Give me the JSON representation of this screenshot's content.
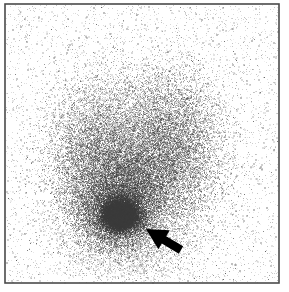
{
  "figure": {
    "name": "scintigram",
    "modality": "nuclear-medicine-scintigraphy",
    "width": 289,
    "height": 292,
    "background_color": "#ffffff",
    "speckle_color": "#3a3a3a",
    "annotation_color": "#000000"
  },
  "frame": {
    "name": "image-border",
    "color": "#4a4a4a",
    "line_width": 1.6,
    "left": 5,
    "top": 4,
    "right": 279,
    "bottom": 283
  },
  "chart_data": {
    "type": "scatter",
    "title": "",
    "subtitle": "",
    "xlabel": "",
    "ylabel": "",
    "grid": false,
    "legend": null,
    "xlim": [
      0,
      289
    ],
    "ylim": [
      0,
      292
    ],
    "background_counts": 5200,
    "background_opacity": 0.3,
    "series": [
      {
        "name": "left-lobe-uptake",
        "shape": "ellipse",
        "cx": 96,
        "cy": 165,
        "rx": 40,
        "ry": 62,
        "counts": 7600,
        "sigma_scale": 0.62,
        "opacity": 0.42
      },
      {
        "name": "right-lobe-uptake",
        "shape": "ellipse",
        "cx": 171,
        "cy": 152,
        "rx": 42,
        "ry": 66,
        "counts": 8000,
        "sigma_scale": 0.62,
        "opacity": 0.42
      },
      {
        "name": "isthmus-bridge-uptake",
        "shape": "ellipse",
        "cx": 133,
        "cy": 186,
        "rx": 34,
        "ry": 40,
        "counts": 4200,
        "sigma_scale": 0.6,
        "opacity": 0.44
      },
      {
        "name": "inferior-pole-uptake",
        "shape": "ellipse",
        "cx": 118,
        "cy": 213,
        "rx": 34,
        "ry": 30,
        "counts": 6200,
        "sigma_scale": 0.58,
        "opacity": 0.5
      },
      {
        "name": "focal-hot-spot",
        "shape": "ellipse",
        "cx": 120,
        "cy": 215,
        "rx": 15,
        "ry": 13,
        "counts": 9000,
        "sigma_scale": 0.52,
        "opacity": 0.72
      },
      {
        "name": "focal-hot-spot-core",
        "shape": "ellipse",
        "cx": 120,
        "cy": 216,
        "rx": 8,
        "ry": 7,
        "counts": 5200,
        "sigma_scale": 0.5,
        "opacity": 0.85
      },
      {
        "name": "superior-halo-uptake",
        "shape": "ellipse",
        "cx": 137,
        "cy": 120,
        "rx": 56,
        "ry": 44,
        "counts": 2600,
        "sigma_scale": 0.66,
        "opacity": 0.3
      },
      {
        "name": "inferior-tail-uptake",
        "shape": "ellipse",
        "cx": 128,
        "cy": 248,
        "rx": 46,
        "ry": 24,
        "counts": 1700,
        "sigma_scale": 0.68,
        "opacity": 0.26
      }
    ]
  },
  "annotations": [
    {
      "name": "pointer-arrow",
      "type": "arrow",
      "label": "",
      "tip_x": 146,
      "tip_y": 229,
      "tail_x": 181,
      "tail_y": 250,
      "shaft_width": 8.5,
      "head_length": 21,
      "head_width": 22,
      "color": "#000000",
      "points_at": "focal-hot-spot"
    }
  ]
}
